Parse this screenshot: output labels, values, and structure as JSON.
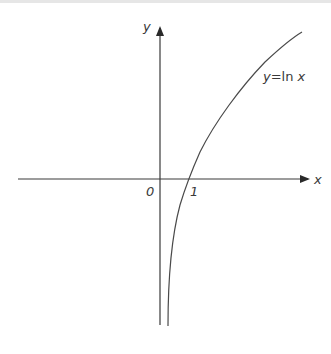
{
  "figure": {
    "type": "function-graph",
    "function_label_y": "y",
    "function_label_eq": "=",
    "function_label_fn": "ln",
    "function_label_x": "x",
    "axes": {
      "x_label": "x",
      "y_label": "y",
      "origin_label": "0",
      "tick_label_one": "1"
    },
    "colors": {
      "axis": "#3a3a3a",
      "curve": "#4a4a4a",
      "background": "#ffffff"
    }
  }
}
